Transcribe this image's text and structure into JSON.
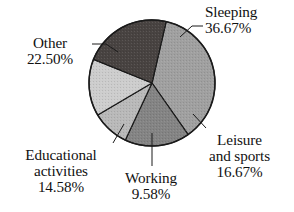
{
  "chart_data": {
    "type": "pie",
    "title": "",
    "subtitle": "",
    "xlabel": "",
    "ylabel": "",
    "legend_position": "none",
    "grid": false,
    "labels_inline": true,
    "unit": "%",
    "categories": [
      "Sleeping",
      "Leisure and sports",
      "Working",
      "Educational activities",
      "Other"
    ],
    "values": [
      36.67,
      16.67,
      9.58,
      14.58,
      22.5
    ],
    "slices": [
      {
        "name": "Sleeping",
        "label_line1": "Sleeping",
        "label_line2": "",
        "label_line3": "",
        "value": 36.67,
        "value_text": "36.67%",
        "color": "#a9a9a9",
        "start_angle": 13,
        "end_angle": 145
      },
      {
        "name": "Leisure and sports",
        "label_line1": "Leisure",
        "label_line2": "and sports",
        "label_line3": "",
        "value": 16.67,
        "value_text": "16.67%",
        "color": "#8b8b8b",
        "start_angle": 145,
        "end_angle": 205
      },
      {
        "name": "Working",
        "label_line1": "Working",
        "label_line2": "",
        "label_line3": "",
        "value": 9.58,
        "value_text": "9.58%",
        "color": "#c3c3c3",
        "start_angle": 205,
        "end_angle": 239.5
      },
      {
        "name": "Educational activities",
        "label_line1": "Educational",
        "label_line2": "activities",
        "label_line3": "",
        "value": 14.58,
        "value_text": "14.58%",
        "color": "#d8d8d8",
        "start_angle": 239.5,
        "end_angle": 292
      },
      {
        "name": "Other",
        "label_line1": "Other",
        "label_line2": "",
        "label_line3": "",
        "value": 22.5,
        "value_text": "22.50%",
        "color": "#4c4745",
        "start_angle": 292,
        "end_angle": 373
      }
    ],
    "geometry": {
      "center_x": 152,
      "center_y": 83,
      "radius": 63,
      "stroke_color": "#1a1a1a",
      "stroke_width": 1.2
    },
    "leader_lines": [
      {
        "for": "Sleeping",
        "x1": 180,
        "y1": 37,
        "x2": 192,
        "y2": 26,
        "x3": 203,
        "y3": 26
      },
      {
        "for": "Other",
        "x1": 118,
        "y1": 52,
        "x2": 106,
        "y2": 44,
        "x3": 92,
        "y3": 44
      },
      {
        "for": "Leisure and sports",
        "x1": 193,
        "y1": 114,
        "x2": 206,
        "y2": 128,
        "x3": 206,
        "y3": 128
      },
      {
        "for": "Educational activities",
        "x1": 124,
        "y1": 124,
        "x2": 113,
        "y2": 143,
        "x3": 113,
        "y3": 143
      },
      {
        "for": "Working",
        "x1": 152,
        "y1": 133,
        "x2": 152,
        "y2": 166,
        "x3": 152,
        "y3": 166
      }
    ]
  }
}
